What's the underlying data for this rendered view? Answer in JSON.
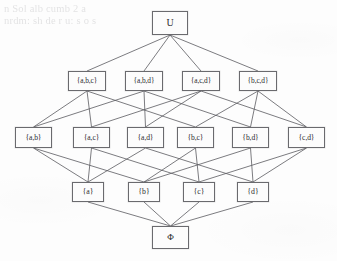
{
  "figure": {
    "type": "hasse-diagram",
    "ghost_text_lines": [
      "n Sol alb cumb  2  a",
      "nrdm:  sh de r u:   s  o s"
    ]
  },
  "nodes": [
    {
      "id": "U",
      "label": "U",
      "level": 0,
      "x": 152,
      "y": 11,
      "w": 36,
      "h": 24,
      "cls": "lvl-top"
    },
    {
      "id": "abc",
      "label": "{a,b,c}",
      "level": 1,
      "x": 68,
      "y": 71,
      "w": 38,
      "h": 20,
      "cls": "lvl-three"
    },
    {
      "id": "abd",
      "label": "{a,b,d}",
      "level": 1,
      "x": 125,
      "y": 71,
      "w": 38,
      "h": 20,
      "cls": "lvl-three"
    },
    {
      "id": "acd",
      "label": "{a,c,d}",
      "level": 1,
      "x": 182,
      "y": 71,
      "w": 38,
      "h": 20,
      "cls": "lvl-three"
    },
    {
      "id": "bcd",
      "label": "{b,c,d}",
      "level": 1,
      "x": 239,
      "y": 71,
      "w": 38,
      "h": 20,
      "cls": "lvl-three"
    },
    {
      "id": "ab",
      "label": "{a,b}",
      "level": 2,
      "x": 15,
      "y": 127,
      "w": 37,
      "h": 21,
      "cls": "lvl-two"
    },
    {
      "id": "ac",
      "label": "{a,c}",
      "level": 2,
      "x": 73,
      "y": 127,
      "w": 37,
      "h": 21,
      "cls": "lvl-two"
    },
    {
      "id": "ad",
      "label": "{a,d}",
      "level": 2,
      "x": 127,
      "y": 127,
      "w": 37,
      "h": 21,
      "cls": "lvl-two"
    },
    {
      "id": "bc",
      "label": "{b,c}",
      "level": 2,
      "x": 177,
      "y": 127,
      "w": 37,
      "h": 21,
      "cls": "lvl-two"
    },
    {
      "id": "bd",
      "label": "{b,d}",
      "level": 2,
      "x": 232,
      "y": 127,
      "w": 37,
      "h": 21,
      "cls": "lvl-two"
    },
    {
      "id": "cd",
      "label": "{c,d}",
      "level": 2,
      "x": 288,
      "y": 127,
      "w": 37,
      "h": 21,
      "cls": "lvl-two"
    },
    {
      "id": "a",
      "label": "{a}",
      "level": 3,
      "x": 72,
      "y": 182,
      "w": 32,
      "h": 20,
      "cls": "lvl-one"
    },
    {
      "id": "b",
      "label": "{b}",
      "level": 3,
      "x": 128,
      "y": 182,
      "w": 32,
      "h": 20,
      "cls": "lvl-one"
    },
    {
      "id": "c",
      "label": "{c}",
      "level": 3,
      "x": 183,
      "y": 182,
      "w": 32,
      "h": 20,
      "cls": "lvl-one"
    },
    {
      "id": "d",
      "label": "{d}",
      "level": 3,
      "x": 237,
      "y": 182,
      "w": 32,
      "h": 20,
      "cls": "lvl-one"
    },
    {
      "id": "phi",
      "label": "Φ",
      "level": 4,
      "x": 152,
      "y": 226,
      "w": 37,
      "h": 23,
      "cls": "lvl-bot"
    }
  ],
  "edges": [
    {
      "from": "U",
      "to": "abc"
    },
    {
      "from": "U",
      "to": "abd"
    },
    {
      "from": "U",
      "to": "acd"
    },
    {
      "from": "U",
      "to": "bcd"
    },
    {
      "from": "abc",
      "to": "ab"
    },
    {
      "from": "abc",
      "to": "ac"
    },
    {
      "from": "abc",
      "to": "bc"
    },
    {
      "from": "abd",
      "to": "ab"
    },
    {
      "from": "abd",
      "to": "ad"
    },
    {
      "from": "abd",
      "to": "bd"
    },
    {
      "from": "acd",
      "to": "ac"
    },
    {
      "from": "acd",
      "to": "ad"
    },
    {
      "from": "acd",
      "to": "cd"
    },
    {
      "from": "bcd",
      "to": "bc"
    },
    {
      "from": "bcd",
      "to": "bd"
    },
    {
      "from": "bcd",
      "to": "cd"
    },
    {
      "from": "ab",
      "to": "a"
    },
    {
      "from": "ab",
      "to": "b"
    },
    {
      "from": "ac",
      "to": "a"
    },
    {
      "from": "ac",
      "to": "c"
    },
    {
      "from": "ad",
      "to": "a"
    },
    {
      "from": "ad",
      "to": "d"
    },
    {
      "from": "bc",
      "to": "b"
    },
    {
      "from": "bc",
      "to": "c"
    },
    {
      "from": "bd",
      "to": "b"
    },
    {
      "from": "bd",
      "to": "d"
    },
    {
      "from": "cd",
      "to": "c"
    },
    {
      "from": "cd",
      "to": "d"
    },
    {
      "from": "a",
      "to": "phi"
    },
    {
      "from": "b",
      "to": "phi"
    },
    {
      "from": "c",
      "to": "phi"
    },
    {
      "from": "d",
      "to": "phi"
    }
  ],
  "colors": {
    "background": "#fdfdfd",
    "node_border": "#6a6a6e",
    "node_fill": "#fcfcfc",
    "edge": "#5b5b5f",
    "label_text": "#2b2b2e",
    "ghost_text": "rgba(90,90,95,0.16)"
  }
}
